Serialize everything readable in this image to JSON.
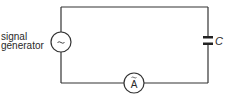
{
  "diagram": {
    "type": "circuit",
    "components": {
      "signal_generator": {
        "label_line1": "signal",
        "label_line2": "generator",
        "symbol": "~"
      },
      "ammeter": {
        "symbol": "A",
        "overmark": "~"
      },
      "capacitor": {
        "label": "C"
      }
    },
    "colors": {
      "wire": "#333333",
      "background": "#ffffff"
    }
  }
}
